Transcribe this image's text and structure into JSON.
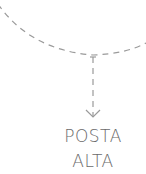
{
  "diagram": {
    "label_lines": [
      "POSTA",
      "ALTA"
    ],
    "stroke_color": "#9a9a9a",
    "text_color": "#6b6b6b"
  }
}
